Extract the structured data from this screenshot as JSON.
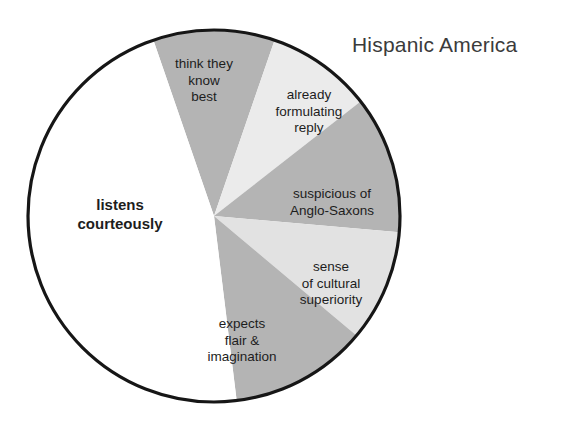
{
  "chart": {
    "title": "Hispanic America"
  },
  "chart_data": {
    "type": "pie",
    "title": "Hispanic America",
    "xlabel": "",
    "ylabel": "",
    "legend_position": "none",
    "grid": false,
    "note": "Slice sizes read off the drawing as sector sweep angles in degrees, clockwise from 12 o'clock.",
    "start_angle_deg": -19,
    "direction": "clockwise",
    "labels": [
      "think they\nknow\nbest",
      "already\nformulating\nreply",
      "suspicious of\nAnglo-Saxons",
      "sense\nof cultural\nsuperiority",
      "expects\nflair &\nimagination",
      "listens\ncourteously"
    ],
    "categories": [
      "think they know best",
      "already formulating reply",
      "suspicious of Anglo-Saxons",
      "sense of cultural superiority",
      "expects flair & imagination",
      "listens courteously"
    ],
    "values": [
      38,
      33,
      43,
      35,
      43,
      168
    ],
    "percentages": [
      10.6,
      9.2,
      11.9,
      9.7,
      11.9,
      46.7
    ],
    "colors": [
      "#b4b4b4",
      "#ebebeb",
      "#b4b4b4",
      "#e2e2e2",
      "#b4b4b4",
      "#ffffff"
    ],
    "slices": [
      {
        "label": "think they know best",
        "start_deg": -19,
        "end_deg": 19,
        "sweep_deg": 38,
        "color": "#b4b4b4",
        "emphasis": false
      },
      {
        "label": "already formulating reply",
        "start_deg": 19,
        "end_deg": 52,
        "sweep_deg": 33,
        "color": "#ebebeb",
        "emphasis": false
      },
      {
        "label": "suspicious of Anglo-Saxons",
        "start_deg": 52,
        "end_deg": 95,
        "sweep_deg": 43,
        "color": "#b4b4b4",
        "emphasis": false
      },
      {
        "label": "sense of cultural superiority",
        "start_deg": 95,
        "end_deg": 130,
        "sweep_deg": 35,
        "color": "#e2e2e2",
        "emphasis": false
      },
      {
        "label": "expects flair & imagination",
        "start_deg": 130,
        "end_deg": 173,
        "sweep_deg": 43,
        "color": "#b4b4b4",
        "emphasis": false
      },
      {
        "label": "listens courteously",
        "start_deg": 173,
        "end_deg": 341,
        "sweep_deg": 168,
        "color": "#ffffff",
        "emphasis": true
      }
    ],
    "outline_color": "#161616",
    "background_color": "#ffffff"
  }
}
